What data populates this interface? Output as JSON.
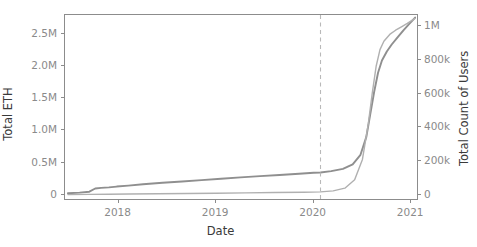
{
  "chart_data": {
    "type": "line",
    "title": "",
    "xlabel": "Date",
    "ylabel": "Total ETH",
    "ylabel_right": "Total Count of Users",
    "grid": false,
    "legend": "none",
    "background_color": "#ffffff",
    "axis_color": "#8c8c8c",
    "tick_label_color": "#8a8a8a",
    "x_axis": {
      "label": "Date",
      "tick_labels": [
        "2018",
        "2019",
        "2020",
        "2021"
      ],
      "tick_values": [
        2018.0,
        2019.0,
        2020.0,
        2021.0
      ],
      "xlim": [
        2017.45,
        2021.08
      ]
    },
    "y_axis_left": {
      "label": "Total ETH",
      "tick_labels": [
        "0",
        "0.5M",
        "1.0M",
        "1.5M",
        "2.0M",
        "2.5M"
      ],
      "tick_values": [
        0,
        500000,
        1000000,
        1500000,
        2000000,
        2500000
      ],
      "ylim": [
        -100000,
        2800000
      ]
    },
    "y_axis_right": {
      "label": "Total Count of Users",
      "tick_labels": [
        "0",
        "200k",
        "400k",
        "600k",
        "800k",
        "1M"
      ],
      "tick_values": [
        0,
        200000,
        400000,
        600000,
        800000,
        1000000
      ],
      "ylim": [
        -36000,
        1065000
      ]
    },
    "annotations": [
      {
        "name": "vertical-dashed-marker",
        "type": "vline",
        "x": 2020.07,
        "style": "dashed",
        "color": "#b9b9b9"
      }
    ],
    "series": [
      {
        "name": "Total ETH",
        "axis": "left",
        "color": "#8f8f8f",
        "line_width": 1.9,
        "units": "ETH",
        "x": [
          2017.48,
          2017.6,
          2017.7,
          2017.76,
          2017.82,
          2017.9,
          2017.98,
          2018.1,
          2018.25,
          2018.45,
          2018.65,
          2018.85,
          2019.05,
          2019.25,
          2019.45,
          2019.65,
          2019.85,
          2020.0,
          2020.07,
          2020.18,
          2020.3,
          2020.4,
          2020.48,
          2020.54,
          2020.58,
          2020.62,
          2020.66,
          2020.7,
          2020.75,
          2020.8,
          2020.86,
          2020.92,
          2020.98,
          2021.04
        ],
        "y": [
          20000,
          30000,
          45000,
          95000,
          105000,
          112000,
          125000,
          140000,
          160000,
          185000,
          205000,
          225000,
          248000,
          268000,
          288000,
          305000,
          325000,
          340000,
          345000,
          365000,
          400000,
          470000,
          620000,
          900000,
          1250000,
          1600000,
          1900000,
          2090000,
          2230000,
          2340000,
          2450000,
          2560000,
          2660000,
          2760000
        ]
      },
      {
        "name": "Total Count of Users",
        "axis": "right",
        "color": "#b0b0b0",
        "line_width": 1.4,
        "units": "users",
        "x": [
          2017.48,
          2017.7,
          2017.9,
          2018.1,
          2018.4,
          2018.7,
          2019.0,
          2019.3,
          2019.6,
          2019.9,
          2020.07,
          2020.2,
          2020.32,
          2020.42,
          2020.5,
          2020.56,
          2020.6,
          2020.64,
          2020.68,
          2020.72,
          2020.78,
          2020.84,
          2020.9,
          2020.96,
          2021.04
        ],
        "y": [
          2000,
          3000,
          4000,
          5000,
          6500,
          8000,
          10000,
          12000,
          14000,
          16000,
          18000,
          24000,
          40000,
          90000,
          210000,
          420000,
          600000,
          760000,
          860000,
          910000,
          950000,
          975000,
          995000,
          1015000,
          1045000
        ]
      }
    ]
  }
}
